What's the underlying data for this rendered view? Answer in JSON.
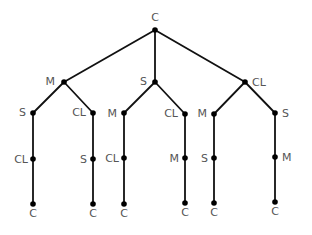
{
  "diagram": {
    "type": "tree",
    "colors": {
      "edge": "#111111",
      "node": "#000000",
      "label": "#555555"
    },
    "nodes": [
      {
        "id": "root",
        "label": "C",
        "x": 155,
        "y": 30,
        "lx": 155,
        "ly": 21,
        "anchor": "middle"
      },
      {
        "id": "m1",
        "label": "M",
        "x": 64,
        "y": 82,
        "lx": 55,
        "ly": 85,
        "anchor": "end"
      },
      {
        "id": "s1",
        "label": "S",
        "x": 155,
        "y": 82,
        "lx": 147,
        "ly": 85,
        "anchor": "end"
      },
      {
        "id": "cl1",
        "label": "CL",
        "x": 245,
        "y": 82,
        "lx": 252,
        "ly": 86,
        "anchor": "start"
      },
      {
        "id": "m1_s",
        "label": "S",
        "x": 33,
        "y": 113,
        "lx": 26,
        "ly": 116,
        "anchor": "end"
      },
      {
        "id": "m1_cl",
        "label": "CL",
        "x": 93,
        "y": 113,
        "lx": 86,
        "ly": 116,
        "anchor": "end"
      },
      {
        "id": "s1_m",
        "label": "M",
        "x": 124,
        "y": 113,
        "lx": 117,
        "ly": 117,
        "anchor": "end"
      },
      {
        "id": "s1_cl",
        "label": "CL",
        "x": 185,
        "y": 114,
        "lx": 178,
        "ly": 117,
        "anchor": "end"
      },
      {
        "id": "cl1_m",
        "label": "M",
        "x": 214,
        "y": 114,
        "lx": 207,
        "ly": 117,
        "anchor": "end"
      },
      {
        "id": "cl1_s",
        "label": "S",
        "x": 275,
        "y": 113,
        "lx": 282,
        "ly": 117,
        "anchor": "start"
      },
      {
        "id": "m1_s_cl",
        "label": "CL",
        "x": 33,
        "y": 159,
        "lx": 28,
        "ly": 163,
        "anchor": "end"
      },
      {
        "id": "m1_cl_s",
        "label": "S",
        "x": 93,
        "y": 159,
        "lx": 87,
        "ly": 163,
        "anchor": "end"
      },
      {
        "id": "s1_m_cl",
        "label": "CL",
        "x": 124,
        "y": 158,
        "lx": 119,
        "ly": 162,
        "anchor": "end"
      },
      {
        "id": "s1_cl_m",
        "label": "M",
        "x": 185,
        "y": 158,
        "lx": 179,
        "ly": 162,
        "anchor": "end"
      },
      {
        "id": "cl1_m_s",
        "label": "S",
        "x": 214,
        "y": 158,
        "lx": 208,
        "ly": 162,
        "anchor": "end"
      },
      {
        "id": "cl1_s_m",
        "label": "M",
        "x": 275,
        "y": 157,
        "lx": 282,
        "ly": 161,
        "anchor": "start"
      },
      {
        "id": "leaf1",
        "label": "C",
        "x": 33,
        "y": 204,
        "lx": 33,
        "ly": 217,
        "anchor": "middle"
      },
      {
        "id": "leaf2",
        "label": "C",
        "x": 93,
        "y": 204,
        "lx": 93,
        "ly": 217,
        "anchor": "middle"
      },
      {
        "id": "leaf3",
        "label": "C",
        "x": 124,
        "y": 204,
        "lx": 124,
        "ly": 217,
        "anchor": "middle"
      },
      {
        "id": "leaf4",
        "label": "C",
        "x": 185,
        "y": 203,
        "lx": 185,
        "ly": 216,
        "anchor": "middle"
      },
      {
        "id": "leaf5",
        "label": "C",
        "x": 214,
        "y": 203,
        "lx": 214,
        "ly": 216,
        "anchor": "middle"
      },
      {
        "id": "leaf6",
        "label": "C",
        "x": 275,
        "y": 202,
        "lx": 275,
        "ly": 215,
        "anchor": "middle"
      }
    ],
    "edges": [
      [
        "root",
        "m1"
      ],
      [
        "root",
        "s1"
      ],
      [
        "root",
        "cl1"
      ],
      [
        "m1",
        "m1_s"
      ],
      [
        "m1",
        "m1_cl"
      ],
      [
        "s1",
        "s1_m"
      ],
      [
        "s1",
        "s1_cl"
      ],
      [
        "cl1",
        "cl1_m"
      ],
      [
        "cl1",
        "cl1_s"
      ],
      [
        "m1_s",
        "m1_s_cl"
      ],
      [
        "m1_cl",
        "m1_cl_s"
      ],
      [
        "s1_m",
        "s1_m_cl"
      ],
      [
        "s1_cl",
        "s1_cl_m"
      ],
      [
        "cl1_m",
        "cl1_m_s"
      ],
      [
        "cl1_s",
        "cl1_s_m"
      ],
      [
        "m1_s_cl",
        "leaf1"
      ],
      [
        "m1_cl_s",
        "leaf2"
      ],
      [
        "s1_m_cl",
        "leaf3"
      ],
      [
        "s1_cl_m",
        "leaf4"
      ],
      [
        "cl1_m_s",
        "leaf5"
      ],
      [
        "cl1_s_m",
        "leaf6"
      ]
    ]
  }
}
